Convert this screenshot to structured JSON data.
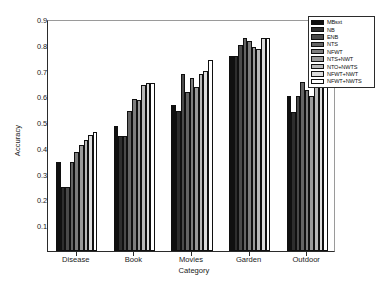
{
  "chart_data": {
    "type": "bar",
    "title": "",
    "xlabel": "Category",
    "ylabel": "Accuracy",
    "ylim": [
      0,
      0.9
    ],
    "ytick_labels": [
      "0.1",
      "0.2",
      "0.3",
      "0.4",
      "0.5",
      "0.6",
      "0.7",
      "0.8",
      "0.9"
    ],
    "ytick_values": [
      0.1,
      0.2,
      0.3,
      0.4,
      0.5,
      0.6,
      0.7,
      0.8,
      0.9
    ],
    "grid": false,
    "legend_position": "top-right",
    "categories": [
      "Disease",
      "Book",
      "Movies",
      "Garden",
      "Outdoor"
    ],
    "series": [
      {
        "name": "MBsxt",
        "color": "#101010",
        "values": [
          0.345,
          0.485,
          0.565,
          0.755,
          0.6
        ]
      },
      {
        "name": "NB",
        "color": "#2e2e2e",
        "values": [
          0.25,
          0.445,
          0.545,
          0.755,
          0.54
        ]
      },
      {
        "name": "ENB",
        "color": "#4a4a4a",
        "values": [
          0.25,
          0.445,
          0.685,
          0.8,
          0.6
        ]
      },
      {
        "name": "NTS",
        "color": "#646464",
        "values": [
          0.345,
          0.545,
          0.615,
          0.825,
          0.655
        ]
      },
      {
        "name": "NFWT",
        "color": "#7d7d7d",
        "values": [
          0.385,
          0.59,
          0.67,
          0.815,
          0.625
        ]
      },
      {
        "name": "NTS+NWT",
        "color": "#9a9a9a",
        "values": [
          0.41,
          0.585,
          0.635,
          0.79,
          0.6
        ]
      },
      {
        "name": "NTO+NWTS",
        "color": "#b8b8b8",
        "values": [
          0.43,
          0.645,
          0.685,
          0.785,
          0.68
        ]
      },
      {
        "name": "NFWT+NWT",
        "color": "#dcdcdc",
        "values": [
          0.45,
          0.65,
          0.7,
          0.825,
          0.73
        ]
      },
      {
        "name": "NFWT+NWTS",
        "color": "#ffffff",
        "values": [
          0.46,
          0.65,
          0.74,
          0.825,
          0.72
        ]
      }
    ]
  }
}
